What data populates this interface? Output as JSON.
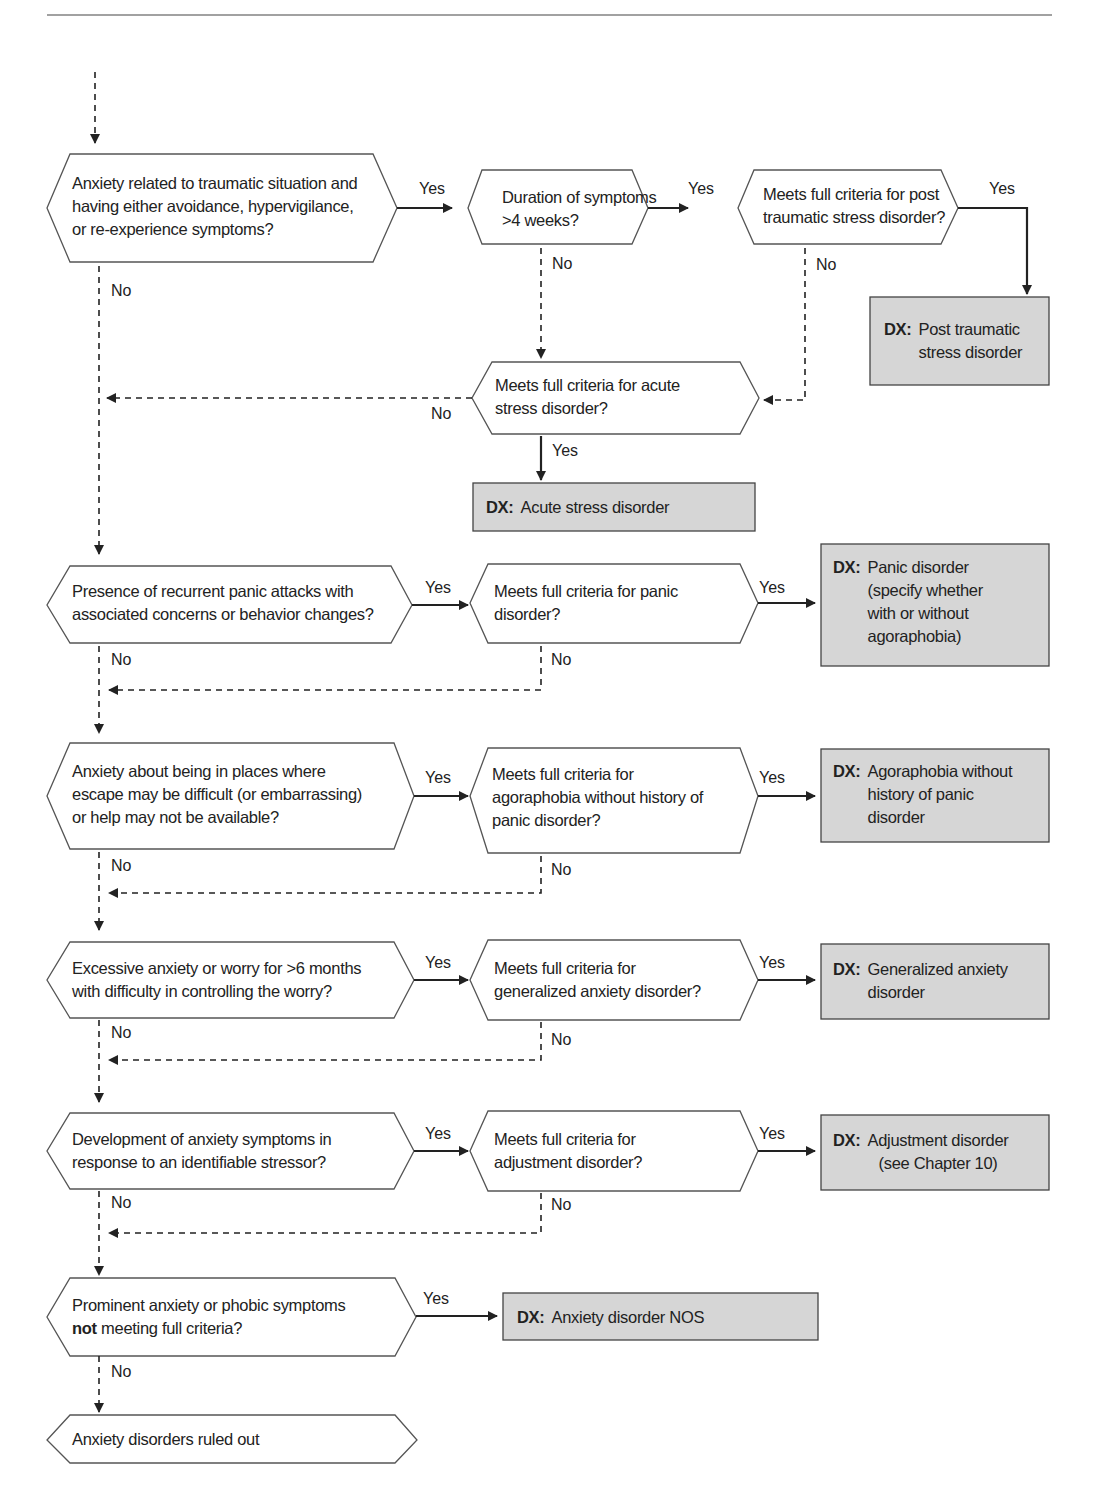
{
  "diagram": {
    "type": "clinical decision flowchart",
    "decisions": [
      {
        "id": "d1",
        "lines": [
          "Anxiety related to traumatic situation and",
          "having either avoidance, hypervigilance,",
          "or re-experience symptoms?"
        ]
      },
      {
        "id": "d2",
        "lines": [
          "Duration of symptoms",
          ">4 weeks?"
        ]
      },
      {
        "id": "d3",
        "lines": [
          "Meets full criteria for post",
          "traumatic stress disorder?"
        ]
      },
      {
        "id": "d4",
        "lines": [
          "Meets full criteria for acute",
          "stress disorder?"
        ]
      },
      {
        "id": "d5",
        "lines": [
          "Presence of recurrent panic attacks with",
          "associated concerns or behavior changes?"
        ]
      },
      {
        "id": "d6",
        "lines": [
          "Meets full criteria for panic",
          "disorder?"
        ]
      },
      {
        "id": "d7",
        "lines": [
          "Anxiety about being in places where",
          "escape may be difficult (or embarrassing)",
          "or help may not be available?"
        ]
      },
      {
        "id": "d8",
        "lines": [
          "Meets full criteria for",
          "agoraphobia without history of",
          "panic disorder?"
        ]
      },
      {
        "id": "d9",
        "lines": [
          "Excessive anxiety or worry for >6 months",
          "with difficulty in controlling the worry?"
        ]
      },
      {
        "id": "d10",
        "lines": [
          "Meets full criteria for",
          "generalized anxiety disorder?"
        ]
      },
      {
        "id": "d11",
        "lines": [
          "Development of anxiety symptoms in",
          "response to an identifiable stressor?"
        ]
      },
      {
        "id": "d12",
        "lines": [
          "Meets full criteria for",
          "adjustment disorder?"
        ]
      },
      {
        "id": "d13",
        "bold_prefix": "not",
        "lines": [
          "Prominent anxiety or phobic symptoms",
          "meeting full criteria?"
        ]
      },
      {
        "id": "end",
        "lines": [
          "Anxiety disorders ruled out"
        ]
      }
    ],
    "dx_prefix": "DX:",
    "diagnoses": [
      {
        "id": "x1",
        "lines": [
          "Post traumatic",
          "stress disorder"
        ]
      },
      {
        "id": "x2",
        "lines": [
          "Acute stress disorder"
        ]
      },
      {
        "id": "x3",
        "lines": [
          "Panic disorder",
          "(specify whether",
          "with or without",
          "agoraphobia)"
        ]
      },
      {
        "id": "x4",
        "lines": [
          "Agoraphobia without",
          "history of panic",
          "disorder"
        ]
      },
      {
        "id": "x5",
        "lines": [
          "Generalized anxiety",
          "disorder"
        ]
      },
      {
        "id": "x6",
        "lines": [
          "Adjustment disorder",
          "(see Chapter 10)"
        ]
      },
      {
        "id": "x7",
        "lines": [
          "Anxiety disorder NOS"
        ]
      }
    ],
    "edge_labels": {
      "yes": "Yes",
      "no": "No"
    },
    "colors": {
      "dx_fill": "#d6d6d6",
      "stroke": "#555555",
      "line": "#222222"
    }
  }
}
